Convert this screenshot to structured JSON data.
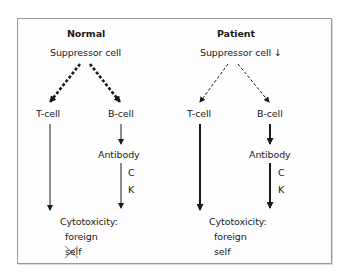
{
  "panels": {
    "normal": {
      "title": "Normal",
      "suppressor": "Suppressor cell",
      "t_cell": "T-cell",
      "b_cell": "B-cell",
      "antibody": "Antibody",
      "c": "C",
      "k": "K",
      "cytotoxicity": "Cytotoxicity:",
      "foreign": "foreign",
      "self": "self",
      "self_crossed": true,
      "suppressor_arrow_style": "thick-dashed",
      "b_to_antibody_style": "thin",
      "antibody_to_cytotoxicity_style": "thin",
      "t_to_cytotoxicity_style": "thin"
    },
    "patient": {
      "title": "Patient",
      "suppressor": "Suppressor cell ↓",
      "t_cell": "T-cell",
      "b_cell": "B-cell",
      "antibody": "Antibody",
      "c": "C",
      "k": "K",
      "cytotoxicity": "Cytotoxicity:",
      "foreign": "foreign",
      "self": "self",
      "self_crossed": false,
      "suppressor_arrow_style": "thin-dashed",
      "b_to_antibody_style": "thick",
      "antibody_to_cytotoxicity_style": "thick",
      "t_to_cytotoxicity_style": "thick"
    }
  },
  "colors": {
    "text": "#1a1a1a",
    "arrow": "#1a1a1a",
    "border": "#9a9a9a",
    "background": "#ffffff"
  }
}
